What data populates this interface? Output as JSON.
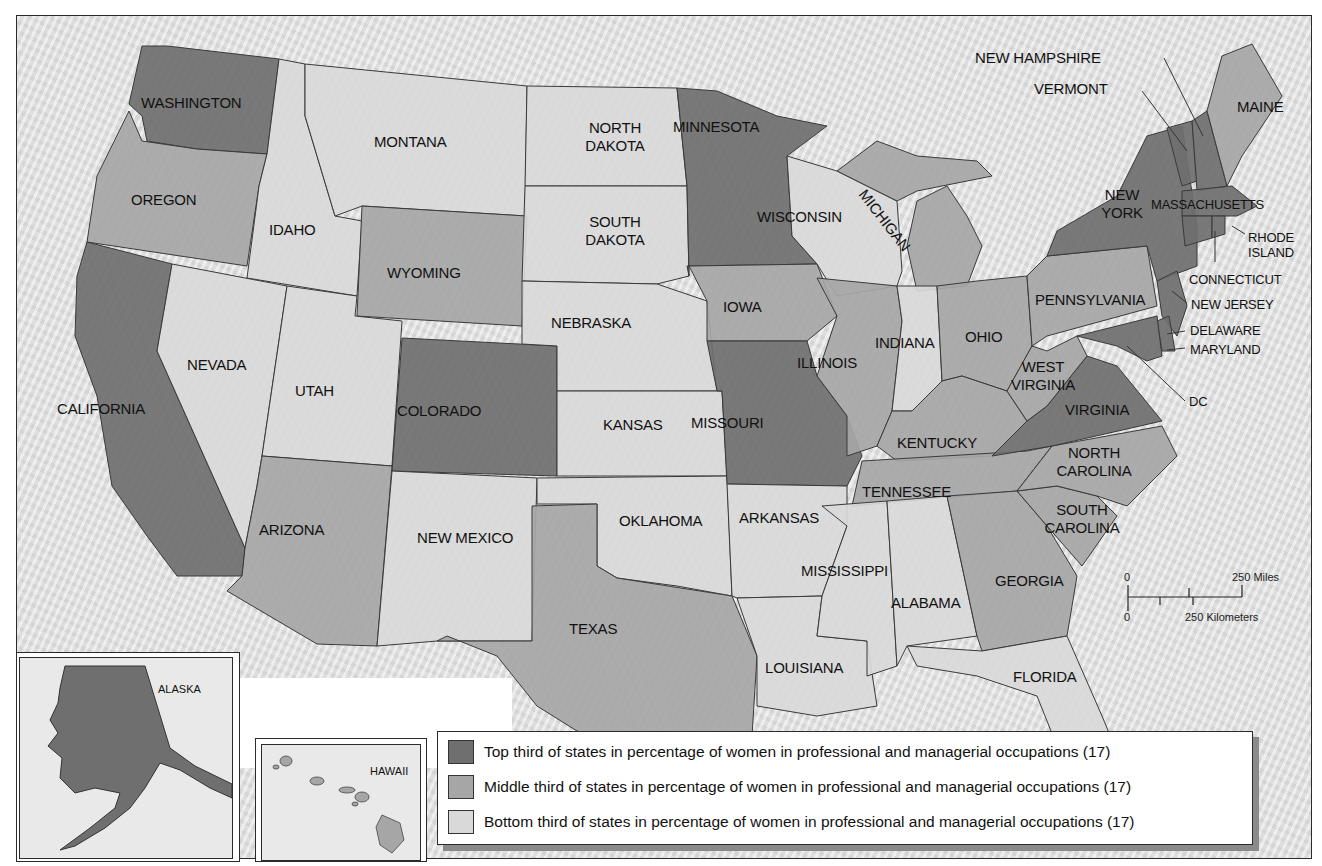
{
  "map": {
    "type": "choropleth",
    "subject": "Percentage of women in professional and managerial occupations, by state",
    "colors": {
      "top": "#6f6f6f",
      "middle": "#a6a6a6",
      "bottom": "#d9d9d9",
      "water": "#ececec",
      "border": "#3a3a3a"
    }
  },
  "legend": {
    "items": [
      {
        "tier": "top",
        "label": "Top third of states in percentage of women in professional and managerial occupations (17)",
        "color": "#6f6f6f"
      },
      {
        "tier": "middle",
        "label": "Middle third of states in percentage of women in professional and managerial occupations (17)",
        "color": "#a6a6a6"
      },
      {
        "tier": "bottom",
        "label": "Bottom third of states in percentage of women in professional and managerial occupations (17)",
        "color": "#d9d9d9"
      }
    ]
  },
  "scale_bar": {
    "miles_zero": "0",
    "miles_label": "250 Miles",
    "km_zero": "0",
    "km_label": "250 Kilometers"
  },
  "insets": {
    "alaska": {
      "label": "ALASKA",
      "tier": "top"
    },
    "hawaii": {
      "label": "HAWAII",
      "tier": "middle"
    }
  },
  "states": {
    "washington": {
      "label": "WASHINGTON",
      "tier": "top"
    },
    "oregon": {
      "label": "OREGON",
      "tier": "middle"
    },
    "california": {
      "label": "CALIFORNIA",
      "tier": "top"
    },
    "idaho": {
      "label": "IDAHO",
      "tier": "bottom"
    },
    "montana": {
      "label": "MONTANA",
      "tier": "bottom"
    },
    "wyoming": {
      "label": "WYOMING",
      "tier": "middle"
    },
    "nevada": {
      "label": "NEVADA",
      "tier": "bottom"
    },
    "utah": {
      "label": "UTAH",
      "tier": "bottom"
    },
    "colorado": {
      "label": "COLORADO",
      "tier": "top"
    },
    "arizona": {
      "label": "ARIZONA",
      "tier": "middle"
    },
    "new_mexico": {
      "label": "NEW MEXICO",
      "tier": "bottom"
    },
    "north_dakota": {
      "label": "NORTH DAKOTA",
      "tier": "bottom"
    },
    "south_dakota": {
      "label": "SOUTH DAKOTA",
      "tier": "bottom"
    },
    "nebraska": {
      "label": "NEBRASKA",
      "tier": "bottom"
    },
    "kansas": {
      "label": "KANSAS",
      "tier": "bottom"
    },
    "oklahoma": {
      "label": "OKLAHOMA",
      "tier": "bottom"
    },
    "texas": {
      "label": "TEXAS",
      "tier": "middle"
    },
    "minnesota": {
      "label": "MINNESOTA",
      "tier": "top"
    },
    "iowa": {
      "label": "IOWA",
      "tier": "middle"
    },
    "missouri": {
      "label": "MISSOURI",
      "tier": "top"
    },
    "arkansas": {
      "label": "ARKANSAS",
      "tier": "bottom"
    },
    "louisiana": {
      "label": "LOUISIANA",
      "tier": "bottom"
    },
    "wisconsin": {
      "label": "WISCONSIN",
      "tier": "bottom"
    },
    "illinois": {
      "label": "ILLINOIS",
      "tier": "middle"
    },
    "michigan": {
      "label": "MICHIGAN",
      "tier": "middle"
    },
    "indiana": {
      "label": "INDIANA",
      "tier": "bottom"
    },
    "ohio": {
      "label": "OHIO",
      "tier": "middle"
    },
    "kentucky": {
      "label": "KENTUCKY",
      "tier": "middle"
    },
    "tennessee": {
      "label": "TENNESSEE",
      "tier": "middle"
    },
    "mississippi": {
      "label": "MISSISSIPPI",
      "tier": "bottom"
    },
    "alabama": {
      "label": "ALABAMA",
      "tier": "bottom"
    },
    "georgia": {
      "label": "GEORGIA",
      "tier": "middle"
    },
    "florida": {
      "label": "FLORIDA",
      "tier": "bottom"
    },
    "south_carolina": {
      "label": "SOUTH CAROLINA",
      "tier": "middle"
    },
    "north_carolina": {
      "label": "NORTH CAROLINA",
      "tier": "middle"
    },
    "virginia": {
      "label": "VIRGINIA",
      "tier": "top"
    },
    "west_virginia": {
      "label": "WEST VIRGINIA",
      "tier": "middle"
    },
    "pennsylvania": {
      "label": "PENNSYLVANIA",
      "tier": "middle"
    },
    "new_york": {
      "label": "NEW YORK",
      "tier": "top"
    },
    "vermont": {
      "label": "VERMONT",
      "tier": "top"
    },
    "new_hampshire": {
      "label": "NEW HAMPSHIRE",
      "tier": "top"
    },
    "maine": {
      "label": "MAINE",
      "tier": "middle"
    },
    "massachusetts": {
      "label": "MASSACHUSETTS",
      "tier": "top"
    },
    "rhode_island": {
      "label": "RHODE ISLAND",
      "tier": "top"
    },
    "connecticut": {
      "label": "CONNECTICUT",
      "tier": "top"
    },
    "new_jersey": {
      "label": "NEW JERSEY",
      "tier": "top"
    },
    "delaware": {
      "label": "DELAWARE",
      "tier": "top"
    },
    "maryland": {
      "label": "MARYLAND",
      "tier": "top"
    },
    "dc": {
      "label": "DC",
      "tier": "top"
    }
  }
}
